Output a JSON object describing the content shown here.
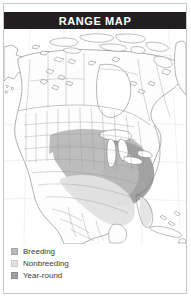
{
  "header": {
    "title": "RANGE MAP",
    "background_color": "#231f20",
    "text_color": "#ffffff"
  },
  "map": {
    "region": "North America",
    "ocean_color": "#ffffff",
    "land_color": "#fdfdfd",
    "border_color": "#9a9a9a",
    "coastline_color": "#6f6f6f",
    "lake_color": "#ffffff",
    "breeding_color": "#b9b9b9",
    "nonbreeding_color": "#e2e2e2",
    "year_round_color": "#9e9e9e"
  },
  "legend": {
    "items": [
      {
        "label": "Breeding",
        "color": "#b9b9b9",
        "swatch_name": "breeding-swatch"
      },
      {
        "label": "Nonbreeding",
        "color": "#e2e2e2",
        "swatch_name": "nonbreeding-swatch"
      },
      {
        "label": "Year-round",
        "color": "#9e9e9e",
        "swatch_name": "year-round-swatch"
      }
    ]
  }
}
